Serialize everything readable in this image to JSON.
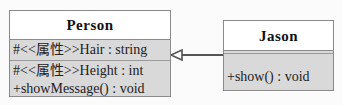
{
  "diagram": {
    "type": "uml-class",
    "classes": [
      {
        "name": "Person",
        "attributes": [
          "#<<属性>>Hair : string"
        ],
        "operations": [
          "#<<属性>>Height : int",
          "+showMessage() : void"
        ]
      },
      {
        "name": "Jason",
        "attributes": [],
        "operations": [
          "+show() : void"
        ]
      }
    ],
    "relations": [
      {
        "type": "generalization",
        "from": "Jason",
        "to": "Person"
      }
    ]
  }
}
